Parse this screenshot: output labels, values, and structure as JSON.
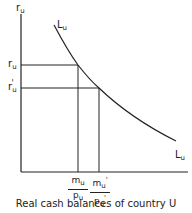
{
  "diagram": {
    "y_axis_label": {
      "base": "r",
      "sub": "u"
    },
    "curve_label_top": {
      "base": "L",
      "sub": "u"
    },
    "curve_label_bottom": {
      "base": "L",
      "sub": "u"
    },
    "y_ticks": [
      {
        "base": "r",
        "sub": "u",
        "prime": ""
      },
      {
        "base": "r",
        "sub": "u",
        "prime": "'"
      }
    ],
    "x_ticks": [
      {
        "num": "mᵤ",
        "den": "pᵤ"
      },
      {
        "num": "mᵤ'",
        "den": "pᵤ'"
      }
    ],
    "x_ticks_text": [
      {
        "num_base": "m",
        "num_sub": "u",
        "num_prime": "",
        "den_base": "p",
        "den_sub": "u",
        "den_prime": ""
      },
      {
        "num_base": "m",
        "num_sub": "u",
        "num_prime": "'",
        "den_base": "p",
        "den_sub": "u",
        "den_prime": "'"
      }
    ],
    "caption": "Real cash balances of country U",
    "colors": {
      "line": "#222222",
      "background": "#ffffff"
    }
  }
}
